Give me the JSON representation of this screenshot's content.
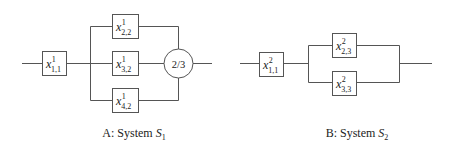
{
  "systemA": {
    "caption_prefix": "A: System ",
    "caption_var": "S",
    "caption_sub": "1",
    "components": [
      {
        "var": "x",
        "sup": "1",
        "sub": "1,1"
      },
      {
        "var": "x",
        "sup": "1",
        "sub": "2,2"
      },
      {
        "var": "x",
        "sup": "1",
        "sub": "3,2"
      },
      {
        "var": "x",
        "sup": "1",
        "sub": "4,2"
      }
    ],
    "voter_label": "2/3"
  },
  "systemB": {
    "caption_prefix": "B: System ",
    "caption_var": "S",
    "caption_sub": "2",
    "components": [
      {
        "var": "x",
        "sup": "2",
        "sub": "1,1"
      },
      {
        "var": "x",
        "sup": "2",
        "sub": "2,3"
      },
      {
        "var": "x",
        "sup": "2",
        "sub": "3,3"
      }
    ]
  },
  "colors": {
    "line": "#555555",
    "text": "#222222",
    "background": "#ffffff"
  }
}
